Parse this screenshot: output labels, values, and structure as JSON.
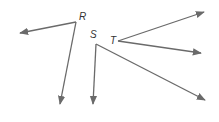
{
  "diagram": {
    "type": "angles",
    "stroke_color": "#6a6a6a",
    "angles": [
      {
        "label": "R",
        "vertex": [
          76,
          22
        ],
        "label_pos": [
          79,
          20
        ],
        "rays": [
          [
            20,
            33
          ],
          [
            60,
            104
          ]
        ]
      },
      {
        "label": "S",
        "vertex": [
          96,
          44
        ],
        "label_pos": [
          90,
          38
        ],
        "rays": [
          [
            93,
            104
          ],
          [
            205,
            100
          ]
        ]
      },
      {
        "label": "T",
        "vertex": [
          118,
          41
        ],
        "label_pos": [
          110,
          44
        ],
        "rays": [
          [
            204,
            12
          ],
          [
            201,
            53
          ]
        ]
      }
    ]
  }
}
